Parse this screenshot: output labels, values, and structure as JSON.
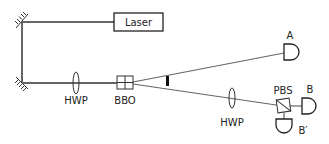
{
  "diagram": {
    "type": "optical-setup",
    "colors": {
      "beam": "#666666",
      "stroke": "#222222",
      "background": "#ffffff"
    },
    "components": {
      "laser": {
        "label": "Laser"
      },
      "hwp_pump": {
        "label": "HWP"
      },
      "bbo": {
        "label": "BBO"
      },
      "hwp_b": {
        "label": "HWP"
      },
      "pbs": {
        "label": "PBS"
      },
      "detector_a": {
        "label": "A"
      },
      "detector_b": {
        "label": "B"
      },
      "detector_b_prime": {
        "label": "B′"
      }
    },
    "edges": [
      {
        "from": "laser",
        "to": "mirror-top"
      },
      {
        "from": "mirror-top",
        "to": "mirror-bottom"
      },
      {
        "from": "mirror-bottom",
        "to": "hwp_pump"
      },
      {
        "from": "hwp_pump",
        "to": "bbo"
      },
      {
        "from": "bbo",
        "to": "detector_a"
      },
      {
        "from": "bbo",
        "to": "hwp_b"
      },
      {
        "from": "hwp_b",
        "to": "pbs"
      },
      {
        "from": "pbs",
        "to": "detector_b"
      },
      {
        "from": "pbs",
        "to": "detector_b_prime"
      }
    ]
  }
}
